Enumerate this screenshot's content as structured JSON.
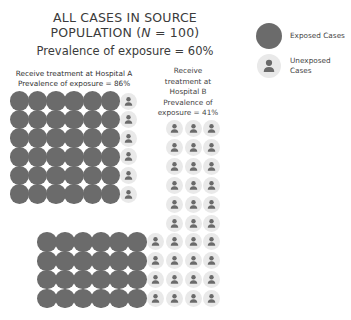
{
  "title": {
    "line1": "ALL CASES IN SOURCE",
    "line2_prefix": "POPULATION (",
    "line2_n": "N",
    "line2_suffix": " = 100)"
  },
  "subtitle": "Prevalence of exposure = 60%",
  "legend": [
    {
      "label": "Exposed Cases",
      "type": "exposed"
    },
    {
      "label_line1": "Unexposed",
      "label_line2": "Cases",
      "type": "unexposed"
    }
  ],
  "groups": {
    "hospital_a": {
      "label_line1": "Receive treatment at Hospital A",
      "label_line2": "Prevalence of exposure = 86%",
      "exposed": 36,
      "unexposed": 6,
      "rows": 6,
      "cols": 7
    },
    "hospital_b": {
      "label_lines": [
        "Receive",
        "treatment at",
        "Hospital B",
        "Prevalence of",
        "exposure = 41%"
      ],
      "exposed": 24,
      "unexposed": 34
    }
  },
  "colors": {
    "exposed": "#6b6b6b",
    "unexposed_bg": "#e9e9e9",
    "icon": "#6a6a6a",
    "text": "#3b3b3b"
  },
  "chart_data": {
    "type": "pictogram",
    "title": "ALL CASES IN SOURCE POPULATION (N = 100)",
    "subtitle": "Prevalence of exposure = 60%",
    "total": 100,
    "total_exposed": 60,
    "total_unexposed": 40,
    "categories": [
      "Hospital A",
      "Hospital B"
    ],
    "series": [
      {
        "name": "Exposed Cases",
        "values": [
          36,
          24
        ]
      },
      {
        "name": "Unexposed Cases",
        "values": [
          6,
          34
        ]
      }
    ],
    "prevalence": {
      "Hospital A": "86%",
      "Hospital B": "41%",
      "Overall": "60%"
    },
    "legend_position": "top-right"
  }
}
